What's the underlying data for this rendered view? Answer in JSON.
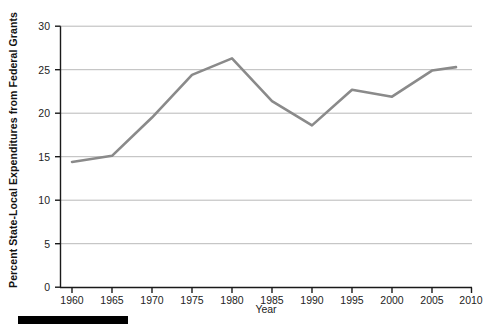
{
  "chart_data": {
    "type": "line",
    "title": "",
    "xlabel": "Year",
    "ylabel": "Percent State-Local Expenditures from Federal Grants",
    "x": [
      1960,
      1965,
      1970,
      1975,
      1980,
      1985,
      1990,
      1995,
      2000,
      2005,
      2008
    ],
    "values": [
      14.4,
      15.1,
      19.5,
      24.4,
      26.3,
      21.4,
      18.6,
      22.7,
      21.9,
      24.9,
      25.3
    ],
    "series": [
      {
        "name": "Percent State-Local Expenditures from Federal Grants",
        "values": [
          14.4,
          15.1,
          19.5,
          24.4,
          26.3,
          21.4,
          18.6,
          22.7,
          21.9,
          24.9,
          25.3
        ]
      }
    ],
    "xlim": [
      1957.5,
      2010
    ],
    "ylim": [
      0,
      30
    ],
    "xticks": [
      1960,
      1965,
      1970,
      1975,
      1980,
      1985,
      1990,
      1995,
      2000,
      2005,
      2010
    ],
    "xtick_labels": [
      "1960",
      "1965",
      "1970",
      "1975",
      "1980",
      "1985",
      "1990",
      "1995",
      "2000",
      "2005",
      "2010"
    ],
    "yticks": [
      0,
      5,
      10,
      15,
      20,
      25,
      30
    ],
    "ytick_labels": [
      "0",
      "5",
      "10",
      "15",
      "20",
      "25",
      "30"
    ],
    "grid": "horizontal",
    "legend": "none",
    "line_color": "#8a8a8a",
    "axis_color": "#1a1a1a",
    "grid_color": "#b9b9b9",
    "background": "#ffffff"
  },
  "artifacts": {
    "footer_bar_label": "page-edge-black-bar"
  }
}
